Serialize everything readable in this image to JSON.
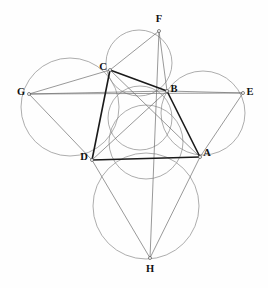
{
  "figure": {
    "background_color": "#fefefe",
    "width": 268,
    "height": 288,
    "colors": {
      "circle_stroke": "#8a8a8a",
      "thin_segment": "#6d6d6d",
      "bold_segment": "#1a1a1a",
      "label_fill": "#111111",
      "vertex_fill": "#ffffff"
    }
  },
  "points": [
    {
      "id": "A",
      "label": "A",
      "x": 200,
      "y": 157,
      "label_x": 207,
      "label_y": 154
    },
    {
      "id": "B",
      "label": "B",
      "x": 167,
      "y": 91,
      "label_x": 174,
      "label_y": 90
    },
    {
      "id": "C",
      "label": "C",
      "x": 110,
      "y": 70,
      "label_x": 103,
      "label_y": 68
    },
    {
      "id": "D",
      "label": "D",
      "x": 92,
      "y": 160,
      "label_x": 84,
      "label_y": 158
    },
    {
      "id": "E",
      "label": "E",
      "x": 243,
      "y": 93,
      "label_x": 250,
      "label_y": 93
    },
    {
      "id": "F",
      "label": "F",
      "x": 159,
      "y": 31,
      "label_x": 159,
      "label_y": 20
    },
    {
      "id": "G",
      "label": "G",
      "x": 29,
      "y": 94,
      "label_x": 21,
      "label_y": 93
    },
    {
      "id": "H",
      "label": "H",
      "x": 150,
      "y": 258,
      "label_x": 150,
      "label_y": 270
    }
  ],
  "circles": [
    {
      "id": "circle-GCD",
      "name": "circumcircle-left",
      "cx": 70,
      "cy": 107,
      "r": 49
    },
    {
      "id": "circle-FCB",
      "name": "circumcircle-top",
      "cx": 139,
      "cy": 63,
      "r": 33
    },
    {
      "id": "circle-BEA",
      "name": "circumcircle-right",
      "cx": 203,
      "cy": 113,
      "r": 42
    },
    {
      "id": "circle-DAH",
      "name": "circumcircle-bottom",
      "cx": 146,
      "cy": 206,
      "r": 53
    },
    {
      "id": "circle-mid1",
      "name": "inner-circle-upper",
      "cx": 140,
      "cy": 118,
      "r": 32
    },
    {
      "id": "circle-mid2",
      "name": "inner-circle-lower",
      "cx": 146,
      "cy": 142,
      "r": 37
    }
  ],
  "bold_segments": [
    {
      "id": "seg-CB",
      "from": "C",
      "to": "B"
    },
    {
      "id": "seg-CD",
      "from": "C",
      "to": "D"
    },
    {
      "id": "seg-DA",
      "from": "D",
      "to": "A"
    },
    {
      "id": "seg-AB",
      "from": "A",
      "to": "B"
    }
  ],
  "thin_segments": [
    {
      "id": "seg-GC",
      "from": "G",
      "to": "C"
    },
    {
      "id": "seg-GD",
      "from": "G",
      "to": "D"
    },
    {
      "id": "seg-GB",
      "from": "G",
      "to": "B"
    },
    {
      "id": "seg-GE",
      "from": "G",
      "to": "E"
    },
    {
      "id": "seg-FC",
      "from": "F",
      "to": "C"
    },
    {
      "id": "seg-FB",
      "from": "F",
      "to": "B"
    },
    {
      "id": "seg-FH",
      "from": "F",
      "to": "H"
    },
    {
      "id": "seg-EB",
      "from": "E",
      "to": "B"
    },
    {
      "id": "seg-EA",
      "from": "E",
      "to": "A"
    },
    {
      "id": "seg-HD",
      "from": "H",
      "to": "D"
    },
    {
      "id": "seg-HA",
      "from": "H",
      "to": "A"
    },
    {
      "id": "seg-CA",
      "from": "C",
      "to": "A"
    },
    {
      "id": "seg-DB",
      "from": "D",
      "to": "B"
    }
  ]
}
